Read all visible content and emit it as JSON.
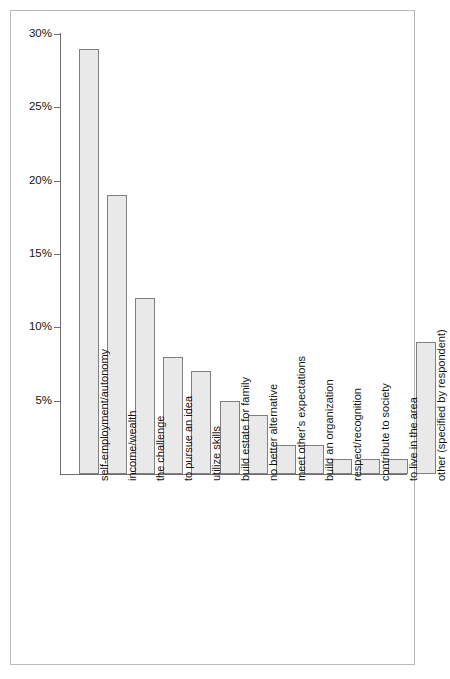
{
  "chart_data": {
    "type": "bar",
    "title": "",
    "subtitle": "",
    "xlabel": "",
    "ylabel": "",
    "categories": [
      "self-employment/autonomy",
      "income/wealth",
      "the challenge",
      "to pursue an idea",
      "utilize skills",
      "build estate for family",
      "no better alternative",
      "meet other's expectations",
      "build an organization",
      "respect/recognition",
      "contribute to society",
      "to live in the area",
      "other (specified by respondent)"
    ],
    "values": [
      29,
      19,
      12,
      8,
      7,
      5,
      4,
      2,
      2,
      1,
      1,
      1,
      9
    ],
    "ylim": [
      0,
      30
    ],
    "ytick_values": [
      5,
      10,
      15,
      20,
      25,
      30
    ],
    "ytick_labels": [
      "5%",
      "10%",
      "15%",
      "20%",
      "25%",
      "30%"
    ],
    "grid": false,
    "legend": false,
    "legend_position": "none",
    "bar_fill_color": "#e9e9e9",
    "bar_border_color": "#808080",
    "axis_color": "#6e6e6e",
    "text_color": "#141414",
    "frame_border_color": "#b9b9b9"
  }
}
